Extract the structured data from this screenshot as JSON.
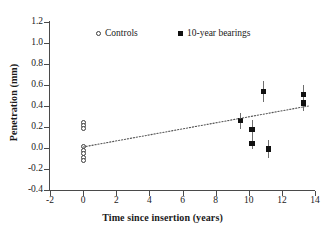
{
  "chart_data": {
    "type": "scatter",
    "title": "",
    "xlabel": "Time since insertion (years)",
    "ylabel": "Penetration (mm)",
    "xlim": [
      -2,
      14
    ],
    "ylim": [
      -0.4,
      1.2
    ],
    "xticks": [
      "-2",
      "0",
      "2",
      "4",
      "6",
      "8",
      "10",
      "12",
      "14"
    ],
    "xtick_values": [
      -2,
      0,
      2,
      4,
      6,
      8,
      10,
      12,
      14
    ],
    "yticks": [
      "-0.4",
      "-0.2",
      "0.0",
      "0.2",
      "0.4",
      "0.6",
      "0.8",
      "1.0",
      "1.2"
    ],
    "ytick_values": [
      -0.4,
      -0.2,
      0.0,
      0.2,
      0.4,
      0.6,
      0.8,
      1.0,
      1.2
    ],
    "grid": false,
    "legend_position": "top-center",
    "series": [
      {
        "name": "Controls",
        "marker": "open-circle",
        "color": "#3c3c3c",
        "points": [
          {
            "x": 0.0,
            "y": 0.245
          },
          {
            "x": 0.0,
            "y": 0.215
          },
          {
            "x": 0.0,
            "y": 0.185
          },
          {
            "x": 0.0,
            "y": 0.01
          },
          {
            "x": 0.0,
            "y": -0.02
          },
          {
            "x": 0.0,
            "y": -0.055
          },
          {
            "x": 0.0,
            "y": -0.09
          },
          {
            "x": 0.0,
            "y": -0.12
          }
        ]
      },
      {
        "name": "10-year bearings",
        "marker": "filled-square",
        "color": "#111111",
        "points": [
          {
            "x": 9.5,
            "y": 0.26,
            "err_low": 0.08,
            "err_high": 0.07
          },
          {
            "x": 10.2,
            "y": 0.175,
            "err_low": 0.09,
            "err_high": 0.09
          },
          {
            "x": 10.2,
            "y": 0.045,
            "err_low": 0.05,
            "err_high": 0.05
          },
          {
            "x": 10.9,
            "y": 0.54,
            "err_low": 0.1,
            "err_high": 0.1
          },
          {
            "x": 11.2,
            "y": -0.01,
            "err_low": 0.09,
            "err_high": 0.09
          },
          {
            "x": 13.3,
            "y": 0.51,
            "err_low": 0.05,
            "err_high": 0.09
          },
          {
            "x": 13.3,
            "y": 0.43,
            "err_low": 0.08,
            "err_high": 0.04
          }
        ]
      }
    ],
    "trendline": {
      "style": "dotted",
      "color": "#555555",
      "x_start": 0.0,
      "y_start": 0.01,
      "x_end": 13.6,
      "y_end": 0.4
    }
  },
  "legend": {
    "items": [
      {
        "label": "Controls",
        "marker": "open-circle"
      },
      {
        "label": "10-year bearings",
        "marker": "filled-square"
      }
    ]
  }
}
